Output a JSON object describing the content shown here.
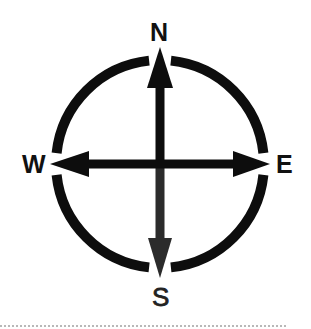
{
  "diagram": {
    "type": "compass-rose",
    "labels": {
      "north": "N",
      "east": "E",
      "south": "S",
      "west": "W"
    },
    "colors": {
      "ring": "#0d0d0d",
      "arrow_north": "#0d0d0d",
      "arrow_east_west": "#0d0d0d",
      "arrow_south": "#2b2b2b",
      "label": "#111111",
      "bottom_rule": "#b8b8b8"
    }
  }
}
